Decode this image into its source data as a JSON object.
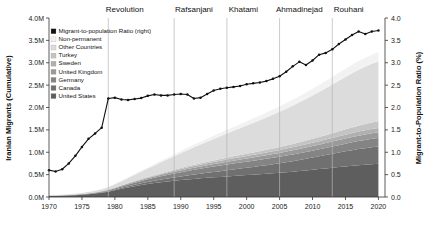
{
  "chart_data": {
    "type": "area",
    "title": "",
    "subtitle": "",
    "xlabel": "",
    "ylabel": "Iranian Migrants (Cumulative)",
    "y2label": "Migrant-to-Population Ratio (%)",
    "xlim": [
      1970,
      2021
    ],
    "ylim": [
      0,
      4000000
    ],
    "y2lim": [
      0,
      4.0
    ],
    "grid": false,
    "legend_position": "upper-left",
    "x_ticks": [
      1970,
      1975,
      1980,
      1985,
      1990,
      1995,
      2000,
      2005,
      2010,
      2015,
      2020
    ],
    "x_tick_labels": [
      "1970",
      "1975",
      "1980",
      "1985",
      "1990",
      "1995",
      "2000",
      "2005",
      "2010",
      "2015",
      "2020"
    ],
    "y_ticks": [
      0,
      500000,
      1000000,
      1500000,
      2000000,
      2500000,
      3000000,
      3500000,
      4000000
    ],
    "y_tick_labels": [
      "0.0M",
      "0.5M",
      "1.0M",
      "1.5M",
      "2.0M",
      "2.5M",
      "3.0M",
      "3.5M",
      "4.0M"
    ],
    "y2_ticks": [
      0.0,
      0.5,
      1.0,
      1.5,
      2.0,
      2.5,
      3.0,
      3.5,
      4.0
    ],
    "y2_tick_labels": [
      "0.0",
      "0.5",
      "1.0",
      "1.5",
      "2.0",
      "2.5",
      "3.0",
      "3.5",
      "4.0"
    ],
    "x": [
      1970,
      1971,
      1972,
      1973,
      1974,
      1975,
      1976,
      1977,
      1978,
      1979,
      1980,
      1981,
      1982,
      1983,
      1984,
      1985,
      1986,
      1987,
      1988,
      1989,
      1990,
      1991,
      1992,
      1993,
      1994,
      1995,
      1996,
      1997,
      1998,
      1999,
      2000,
      2001,
      2002,
      2003,
      2004,
      2005,
      2006,
      2007,
      2008,
      2009,
      2010,
      2011,
      2012,
      2013,
      2014,
      2015,
      2016,
      2017,
      2018,
      2019,
      2020
    ],
    "series": [
      {
        "name": "United States",
        "color": "#5e5e5e",
        "values": [
          22000,
          25000,
          29000,
          34000,
          41000,
          50000,
          62000,
          77000,
          96000,
          120000,
          152000,
          185000,
          215000,
          243000,
          268000,
          291000,
          311000,
          330000,
          347000,
          363000,
          378000,
          392000,
          405000,
          417000,
          428000,
          439000,
          449000,
          459000,
          469000,
          479000,
          489000,
          499000,
          509000,
          519000,
          530000,
          541000,
          553000,
          566000,
          580000,
          594000,
          609000,
          624000,
          639000,
          654000,
          669000,
          684000,
          698000,
          711000,
          723000,
          734000,
          744000
        ]
      },
      {
        "name": "Canada",
        "color": "#707070",
        "values": [
          1500,
          1800,
          2200,
          2700,
          3400,
          4200,
          5200,
          6600,
          8400,
          11000,
          15000,
          20000,
          26000,
          32000,
          38000,
          45000,
          52000,
          59000,
          66000,
          73000,
          80000,
          88000,
          96000,
          104000,
          112000,
          120000,
          129000,
          138000,
          147000,
          156000,
          165000,
          174000,
          183000,
          193000,
          203000,
          213000,
          224000,
          235000,
          247000,
          259000,
          271000,
          284000,
          297000,
          310000,
          323000,
          336000,
          348000,
          359000,
          369000,
          378000,
          386000
        ]
      },
      {
        "name": "Germany",
        "color": "#848484",
        "values": [
          3000,
          3600,
          4300,
          5200,
          6300,
          7700,
          9500,
          12000,
          15000,
          19000,
          25000,
          32000,
          39000,
          46000,
          53000,
          60000,
          67000,
          74000,
          81000,
          88000,
          95000,
          101000,
          107000,
          112000,
          117000,
          121000,
          125000,
          128000,
          131000,
          134000,
          136000,
          138000,
          140000,
          142000,
          144000,
          146000,
          148000,
          150000,
          152000,
          154000,
          156000,
          158000,
          161000,
          164000,
          167000,
          171000,
          175000,
          179000,
          183000,
          187000,
          190000
        ]
      },
      {
        "name": "United Kingdom",
        "color": "#9a9a9a",
        "values": [
          1200,
          1400,
          1700,
          2100,
          2600,
          3200,
          4000,
          5100,
          6500,
          8300,
          11000,
          14000,
          17000,
          20000,
          23000,
          26000,
          29000,
          32000,
          35000,
          38000,
          41000,
          44000,
          47000,
          50000,
          53000,
          56000,
          59000,
          62000,
          65000,
          68000,
          71000,
          74000,
          77000,
          80000,
          83000,
          86000,
          89000,
          92000,
          95000,
          98000,
          101000,
          104000,
          107000,
          110000,
          113000,
          116000,
          119000,
          122000,
          124000,
          126000,
          128000
        ]
      },
      {
        "name": "Sweden",
        "color": "#b0b0b0",
        "values": [
          600,
          700,
          850,
          1000,
          1250,
          1550,
          1950,
          2500,
          3200,
          4100,
          5400,
          7000,
          8800,
          10800,
          13000,
          15500,
          18200,
          21000,
          24000,
          27000,
          30000,
          33000,
          36000,
          39000,
          42000,
          45000,
          47500,
          50000,
          52000,
          54000,
          56000,
          58000,
          60000,
          62000,
          64000,
          66000,
          68000,
          70000,
          72000,
          74000,
          76000,
          78000,
          80000,
          82000,
          84000,
          86000,
          88000,
          90000,
          91500,
          93000,
          94000
        ]
      },
      {
        "name": "Turkey",
        "color": "#c4c4c4",
        "values": [
          500,
          600,
          700,
          850,
          1050,
          1300,
          1650,
          2100,
          2700,
          3500,
          4600,
          6000,
          7500,
          9200,
          11000,
          13000,
          15000,
          17200,
          19500,
          22000,
          24500,
          27000,
          29500,
          32000,
          34500,
          37000,
          39500,
          42000,
          44500,
          47000,
          49500,
          52000,
          55000,
          58000,
          61000,
          64000,
          68000,
          72000,
          76000,
          81000,
          86000,
          92000,
          98000,
          105000,
          112000,
          119000,
          126000,
          133000,
          139000,
          145000,
          150000
        ]
      },
      {
        "name": "Other Countries",
        "color": "#dcdcdc",
        "values": [
          8000,
          9500,
          11500,
          14000,
          17000,
          21000,
          26000,
          33000,
          42000,
          54000,
          70000,
          90000,
          112000,
          136000,
          161000,
          187000,
          214000,
          242000,
          271000,
          300000,
          330000,
          360000,
          390000,
          420000,
          450000,
          480000,
          510000,
          540000,
          570000,
          600000,
          630000,
          661000,
          692000,
          724000,
          757000,
          790000,
          824000,
          859000,
          895000,
          932000,
          970000,
          1009000,
          1049000,
          1090000,
          1131000,
          1172000,
          1211000,
          1248000,
          1282000,
          1313000,
          1340000
        ]
      },
      {
        "name": "Non-permanent",
        "color": "#f2f2f2",
        "values": [
          1000,
          1200,
          1500,
          1800,
          2200,
          2800,
          3500,
          4500,
          5800,
          7500,
          10000,
          13000,
          16500,
          20000,
          24000,
          28000,
          32000,
          36000,
          40500,
          45000,
          49500,
          54000,
          58500,
          63000,
          67500,
          72000,
          76500,
          81000,
          85500,
          90000,
          94500,
          99000,
          104000,
          109000,
          114000,
          119000,
          124500,
          130000,
          136000,
          142000,
          148000,
          154500,
          161000,
          168000,
          175000,
          182000,
          188500,
          194500,
          200000,
          205000,
          209000
        ]
      }
    ],
    "line": {
      "name": "Migrant-to-population Ratio (right)",
      "color": "#111111",
      "axis": "right",
      "values": [
        0.6,
        0.57,
        0.62,
        0.75,
        0.92,
        1.12,
        1.3,
        1.42,
        1.55,
        2.2,
        2.22,
        2.18,
        2.17,
        2.19,
        2.21,
        2.26,
        2.29,
        2.27,
        2.27,
        2.29,
        2.3,
        2.29,
        2.2,
        2.22,
        2.3,
        2.38,
        2.42,
        2.44,
        2.46,
        2.48,
        2.52,
        2.54,
        2.56,
        2.59,
        2.64,
        2.7,
        2.8,
        2.92,
        3.02,
        2.95,
        3.05,
        3.18,
        3.22,
        3.3,
        3.42,
        3.52,
        3.62,
        3.7,
        3.64,
        3.7,
        3.72
      ]
    },
    "era_markers": [
      {
        "label": "Revolution",
        "year": 1979,
        "label_year": 1981.5
      },
      {
        "label": "Rafsanjani",
        "year": 1989,
        "label_year": 1992.0
      },
      {
        "label": "Khatami",
        "year": 1997,
        "label_year": 1999.5
      },
      {
        "label": "Ahmadinejad",
        "year": 2005,
        "label_year": 2008.0
      },
      {
        "label": "Rouhani",
        "year": 2013,
        "label_year": 2015.5
      }
    ]
  },
  "legend": {
    "items": [
      {
        "label": "Migrant-to-population Ratio (right)",
        "color": "#111111"
      },
      {
        "label": "Non-permanent",
        "color": "#f2f2f2"
      },
      {
        "label": "Other Countries",
        "color": "#dcdcdc"
      },
      {
        "label": "Turkey",
        "color": "#c4c4c4"
      },
      {
        "label": "Sweden",
        "color": "#b0b0b0"
      },
      {
        "label": "United Kingdom",
        "color": "#9a9a9a"
      },
      {
        "label": "Germany",
        "color": "#848484"
      },
      {
        "label": "Canada",
        "color": "#707070"
      },
      {
        "label": "United States",
        "color": "#5e5e5e"
      }
    ]
  }
}
